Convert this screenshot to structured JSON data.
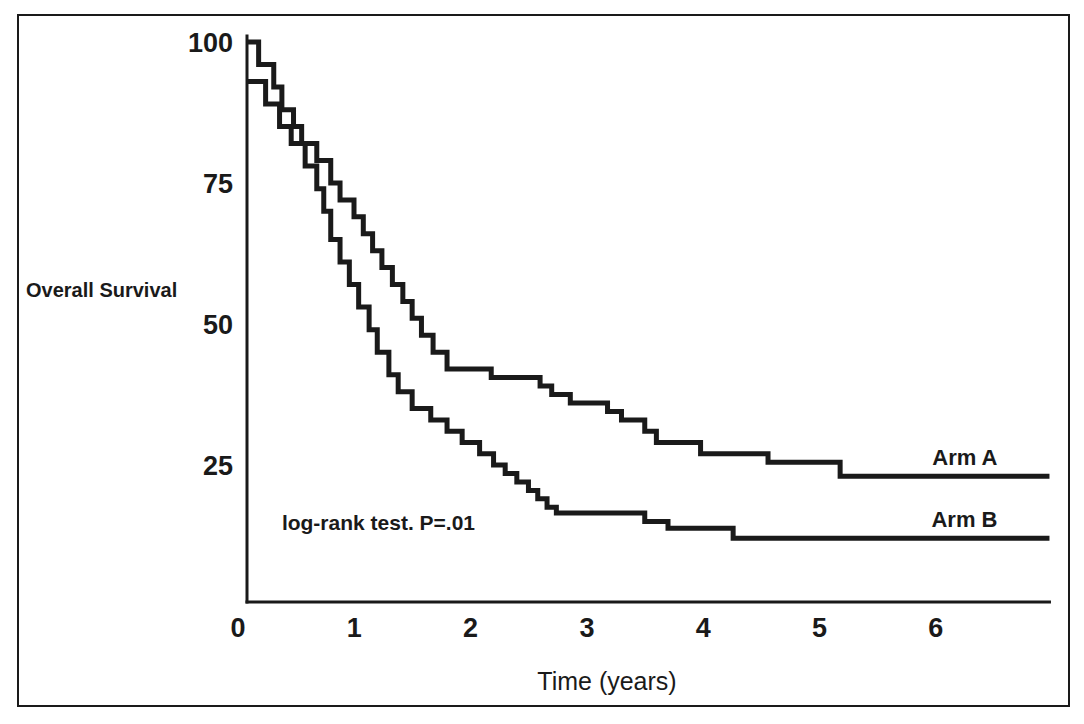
{
  "figure": {
    "border_color": "#1a1a1a",
    "background": "#ffffff"
  },
  "chart_data": {
    "type": "line",
    "subtype": "kaplan-meier-step",
    "title": "",
    "xlabel": "Time (years)",
    "ylabel": "Overall Survival",
    "xlim": [
      0,
      6.9
    ],
    "ylim": [
      0,
      100
    ],
    "xticks": [
      0,
      1,
      2,
      3,
      4,
      5,
      6
    ],
    "xticklabels": [
      "0",
      "1",
      "2",
      "3",
      "4",
      "5",
      "6"
    ],
    "yticks": [
      25,
      50,
      75,
      100
    ],
    "yticklabels": [
      "25",
      "50",
      "75",
      "100"
    ],
    "grid": false,
    "legend_position": "inline-right",
    "annotations": [
      {
        "name": "log-rank-annotation",
        "text": "log-rank test.  P=.01",
        "x": 0.3,
        "y": 13.5
      }
    ],
    "series": [
      {
        "name": "Arm A",
        "label": "Arm A",
        "color": "#1a1a1a",
        "final_survival": 23,
        "points": [
          [
            0.0,
            100
          ],
          [
            0.1,
            100
          ],
          [
            0.1,
            96
          ],
          [
            0.23,
            96
          ],
          [
            0.23,
            92
          ],
          [
            0.3,
            92
          ],
          [
            0.3,
            88
          ],
          [
            0.4,
            88
          ],
          [
            0.4,
            85
          ],
          [
            0.47,
            85
          ],
          [
            0.47,
            82
          ],
          [
            0.6,
            82
          ],
          [
            0.6,
            79
          ],
          [
            0.72,
            79
          ],
          [
            0.72,
            75
          ],
          [
            0.8,
            75
          ],
          [
            0.8,
            72
          ],
          [
            0.92,
            72
          ],
          [
            0.92,
            69
          ],
          [
            1.0,
            69
          ],
          [
            1.0,
            66
          ],
          [
            1.08,
            66
          ],
          [
            1.08,
            63
          ],
          [
            1.16,
            63
          ],
          [
            1.16,
            60
          ],
          [
            1.25,
            60
          ],
          [
            1.25,
            57
          ],
          [
            1.34,
            57
          ],
          [
            1.34,
            54
          ],
          [
            1.42,
            54
          ],
          [
            1.42,
            51
          ],
          [
            1.5,
            51
          ],
          [
            1.5,
            48
          ],
          [
            1.6,
            48
          ],
          [
            1.6,
            45
          ],
          [
            1.72,
            45
          ],
          [
            1.72,
            42
          ],
          [
            2.1,
            42
          ],
          [
            2.1,
            40.5
          ],
          [
            2.52,
            40.5
          ],
          [
            2.52,
            39
          ],
          [
            2.62,
            39
          ],
          [
            2.62,
            37.5
          ],
          [
            2.78,
            37.5
          ],
          [
            2.78,
            36
          ],
          [
            3.1,
            36
          ],
          [
            3.1,
            34.5
          ],
          [
            3.22,
            34.5
          ],
          [
            3.22,
            33
          ],
          [
            3.42,
            33
          ],
          [
            3.42,
            31
          ],
          [
            3.52,
            31
          ],
          [
            3.52,
            29
          ],
          [
            3.9,
            29
          ],
          [
            3.9,
            27
          ],
          [
            4.48,
            27
          ],
          [
            4.48,
            25.5
          ],
          [
            5.1,
            25.5
          ],
          [
            5.1,
            23
          ],
          [
            6.9,
            23
          ]
        ]
      },
      {
        "name": "Arm B",
        "label": "Arm B",
        "color": "#1a1a1a",
        "final_survival": 12,
        "points": [
          [
            0.0,
            93
          ],
          [
            0.16,
            93
          ],
          [
            0.16,
            89
          ],
          [
            0.28,
            89
          ],
          [
            0.28,
            85
          ],
          [
            0.38,
            85
          ],
          [
            0.38,
            82
          ],
          [
            0.5,
            82
          ],
          [
            0.5,
            78
          ],
          [
            0.6,
            78
          ],
          [
            0.6,
            74
          ],
          [
            0.66,
            74
          ],
          [
            0.66,
            70
          ],
          [
            0.72,
            70
          ],
          [
            0.72,
            65
          ],
          [
            0.8,
            65
          ],
          [
            0.8,
            61
          ],
          [
            0.88,
            61
          ],
          [
            0.88,
            57
          ],
          [
            0.96,
            57
          ],
          [
            0.96,
            53
          ],
          [
            1.05,
            53
          ],
          [
            1.05,
            49
          ],
          [
            1.12,
            49
          ],
          [
            1.12,
            45
          ],
          [
            1.22,
            45
          ],
          [
            1.22,
            41
          ],
          [
            1.3,
            41
          ],
          [
            1.3,
            38
          ],
          [
            1.42,
            38
          ],
          [
            1.42,
            35
          ],
          [
            1.58,
            35
          ],
          [
            1.58,
            33
          ],
          [
            1.72,
            33
          ],
          [
            1.72,
            31
          ],
          [
            1.85,
            31
          ],
          [
            1.85,
            29
          ],
          [
            2.0,
            29
          ],
          [
            2.0,
            27
          ],
          [
            2.12,
            27
          ],
          [
            2.12,
            25
          ],
          [
            2.22,
            25
          ],
          [
            2.22,
            23.5
          ],
          [
            2.32,
            23.5
          ],
          [
            2.32,
            22
          ],
          [
            2.42,
            22
          ],
          [
            2.42,
            20.5
          ],
          [
            2.5,
            20.5
          ],
          [
            2.5,
            19
          ],
          [
            2.58,
            19
          ],
          [
            2.58,
            17.5
          ],
          [
            2.66,
            17.5
          ],
          [
            2.66,
            16.5
          ],
          [
            3.42,
            16.5
          ],
          [
            3.42,
            15
          ],
          [
            3.62,
            15
          ],
          [
            3.62,
            13.8
          ],
          [
            4.18,
            13.8
          ],
          [
            4.18,
            12
          ],
          [
            6.9,
            12
          ]
        ]
      }
    ]
  }
}
